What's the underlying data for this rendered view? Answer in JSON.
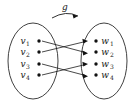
{
  "figure": {
    "map_label": "g",
    "domain_set": {
      "name": "domain-ellipse",
      "nodes": [
        {
          "label": "v",
          "sub": "1"
        },
        {
          "label": "v",
          "sub": "2"
        },
        {
          "label": "v",
          "sub": "3"
        },
        {
          "label": "v",
          "sub": "4"
        }
      ]
    },
    "codomain_set": {
      "name": "codomain-ellipse",
      "nodes": [
        {
          "label": "w",
          "sub": "1"
        },
        {
          "label": "w",
          "sub": "2"
        },
        {
          "label": "w",
          "sub": "3"
        },
        {
          "label": "w",
          "sub": "4"
        }
      ]
    },
    "edges": [
      {
        "from": "v1",
        "to": "w2"
      },
      {
        "from": "v2",
        "to": "w1"
      },
      {
        "from": "v3",
        "to": "w4"
      },
      {
        "from": "v4",
        "to": "w3"
      }
    ],
    "colors": {
      "stroke": "#1a1a1a",
      "ellipse": "#2b2b2b",
      "background": "#ffffff"
    }
  }
}
